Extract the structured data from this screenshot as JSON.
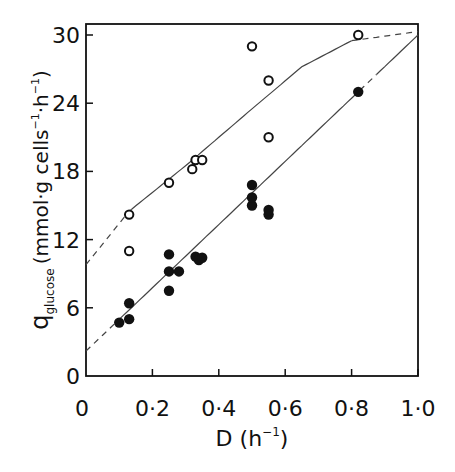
{
  "chart_data": {
    "type": "scatter",
    "title": "",
    "xlabel": "D (h⁻¹)",
    "ylabel": "q_glucose (mmol·g cells⁻¹·h⁻¹)",
    "xlim": [
      0,
      1.0
    ],
    "ylim": [
      0,
      30
    ],
    "x_ticks": [
      "0",
      "0·2",
      "0·4",
      "0·6",
      "0·8",
      "1·0"
    ],
    "x_tick_values": [
      0,
      0.2,
      0.4,
      0.6,
      0.8,
      1.0
    ],
    "y_ticks": [
      "0",
      "6",
      "12",
      "18",
      "24",
      "30"
    ],
    "y_tick_values": [
      0,
      6,
      12,
      18,
      24,
      30
    ],
    "grid": false,
    "series": [
      {
        "name": "open circles",
        "marker": "open-circle",
        "points": [
          [
            0.13,
            14.2
          ],
          [
            0.13,
            11.0
          ],
          [
            0.25,
            17.0
          ],
          [
            0.32,
            18.2
          ],
          [
            0.33,
            19.0
          ],
          [
            0.35,
            19.0
          ],
          [
            0.5,
            29.0
          ],
          [
            0.55,
            26.0
          ],
          [
            0.55,
            21.0
          ],
          [
            0.82,
            30.0
          ]
        ],
        "fit": {
          "style": "curve",
          "points": [
            [
              0,
              9.8
            ],
            [
              0.13,
              14.5
            ],
            [
              0.3,
              18.5
            ],
            [
              0.5,
              23.5
            ],
            [
              0.65,
              27.2
            ],
            [
              0.8,
              29.5
            ],
            [
              1.0,
              30.3
            ]
          ],
          "dashed_ranges": [
            [
              0,
              0.13
            ],
            [
              0.8,
              1.0
            ]
          ]
        }
      },
      {
        "name": "filled circles",
        "marker": "filled-circle",
        "points": [
          [
            0.1,
            4.7
          ],
          [
            0.13,
            5.0
          ],
          [
            0.13,
            6.4
          ],
          [
            0.25,
            7.5
          ],
          [
            0.25,
            9.2
          ],
          [
            0.25,
            10.7
          ],
          [
            0.28,
            9.2
          ],
          [
            0.33,
            10.5
          ],
          [
            0.34,
            10.2
          ],
          [
            0.35,
            10.4
          ],
          [
            0.5,
            15.0
          ],
          [
            0.5,
            15.7
          ],
          [
            0.5,
            16.8
          ],
          [
            0.55,
            14.2
          ],
          [
            0.55,
            14.6
          ],
          [
            0.82,
            25.0
          ]
        ],
        "fit": {
          "style": "line",
          "points": [
            [
              0,
              2.2
            ],
            [
              1.0,
              30.0
            ]
          ],
          "dashed_ranges": [
            [
              0,
              0.1
            ],
            [
              0.82,
              0.87
            ]
          ]
        }
      }
    ]
  },
  "labels": {
    "x_axis": "D (h",
    "x_axis_sup": "−1",
    "x_axis_close": ")",
    "y_q": "q",
    "y_sub": "glucose",
    "y_units": "(mmol·g cells",
    "y_sup1": "−1",
    "y_mid": "·h",
    "y_sup2": "−1",
    "y_close": ")"
  }
}
